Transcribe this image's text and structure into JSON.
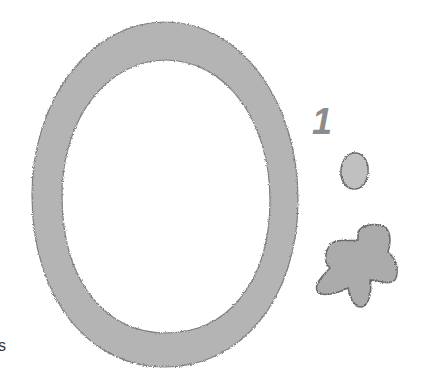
{
  "scene": {
    "description": "Crayon-textured gray shapes on white: a large oval ring, the numeral 1, a small dot and a flower-like blob",
    "background_color": "#ffffff",
    "fill_color": "#b4b4b4",
    "edge_color": "#7a7a7a"
  },
  "labels": {
    "numeral": "1",
    "edge_fragment": "s"
  },
  "shapes": [
    {
      "name": "oval-ring",
      "type": "ring"
    },
    {
      "name": "small-dot",
      "type": "blob"
    },
    {
      "name": "flower-blob",
      "type": "blob"
    }
  ]
}
